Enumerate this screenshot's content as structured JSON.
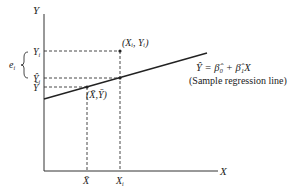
{
  "diagram": {
    "type": "regression_scatter",
    "axes": {
      "x_label": "X",
      "y_label": "Y"
    },
    "y_ticks": [
      {
        "id": "yi",
        "label": "Y",
        "sub": "i"
      },
      {
        "id": "yhat_i",
        "label": "Ŷ",
        "sub": "i"
      },
      {
        "id": "ybar",
        "label": "Ȳ",
        "sub": ""
      }
    ],
    "x_ticks": [
      {
        "id": "xbar",
        "label": "X̄",
        "sub": ""
      },
      {
        "id": "xi",
        "label": "X",
        "sub": "i"
      }
    ],
    "points": {
      "observed": "(Xᵢ, Yᵢ)",
      "mean": "(X̄,Ȳ)"
    },
    "residual_label": {
      "text": "e",
      "sub": "i"
    },
    "equation": "Ŷ = β̂₀ + β̂₁X",
    "caption": "(Sample regression line)",
    "colors": {
      "line": "#222222",
      "dash": "#333333",
      "text": "#222222"
    }
  }
}
